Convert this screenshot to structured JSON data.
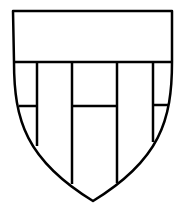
{
  "figure": {
    "type": "heraldic-shield",
    "stroke_color": "#000000",
    "fill_color": "#ffffff",
    "stroke_width": 2.5
  }
}
